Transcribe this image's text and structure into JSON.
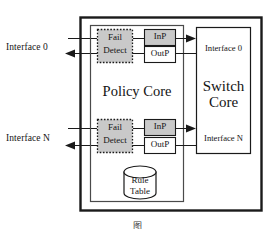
{
  "figure": {
    "type": "block-diagram",
    "caption": "图",
    "colors": {
      "page_background": "#ffffff",
      "line": "#1a1a1a",
      "shaded_fill": "#c9c9c9",
      "white_fill": "#ffffff",
      "text": "#141414"
    }
  },
  "outer_system_box": {
    "label": ""
  },
  "policy_core": {
    "title": "Policy Core",
    "fail_detect_blocks": [
      {
        "line1": "Fail",
        "line2": "Detect",
        "style": "dotted-border shaded"
      },
      {
        "line1": "Fail",
        "line2": "Detect",
        "style": "dotted-border shaded"
      }
    ],
    "port_blocks": [
      {
        "label": "InP",
        "style": "shaded"
      },
      {
        "label": "OutP",
        "style": "shaded"
      },
      {
        "label": "InP",
        "style": "shaded"
      },
      {
        "label": "OutP",
        "style": "shaded"
      }
    ],
    "rule_table": {
      "line1": "Rule",
      "line2": "Table",
      "shape": "cylinder"
    }
  },
  "switch_core": {
    "title_line1": "Switch",
    "title_line2": "Core",
    "interfaces": [
      {
        "label": "Interface 0"
      },
      {
        "label": "Interface N"
      }
    ]
  },
  "external_interfaces": [
    {
      "label": "Interface 0"
    },
    {
      "label": "Interface N"
    }
  ]
}
